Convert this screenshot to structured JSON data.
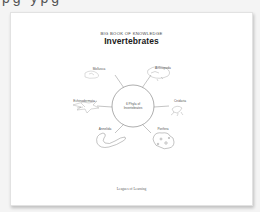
{
  "top_strip": {
    "text": "pg ypg"
  },
  "page": {
    "kicker": "BIG BOOK OF KNOWLEDGE",
    "title": "Invertebrates",
    "diagram": {
      "center_label_line1": "6 Phyla of",
      "center_label_line2": "Invertebrates",
      "branches": [
        {
          "label": "Mollusca",
          "icon": "snail-icon"
        },
        {
          "label": "Arthropoda",
          "icon": "crab-icon"
        },
        {
          "label": "Echinodermata",
          "icon": "starfish-icon"
        },
        {
          "label": "Cnidaria",
          "icon": "jellyfish-icon"
        },
        {
          "label": "Annelida",
          "icon": "worm-icon"
        },
        {
          "label": "Porifera",
          "icon": "sponge-icon"
        }
      ]
    },
    "footer": "Leagues of Learning"
  },
  "colors": {
    "background": "#f4f4f4",
    "page": "#ffffff",
    "ink": "#1a1a1a",
    "line": "#777777"
  }
}
